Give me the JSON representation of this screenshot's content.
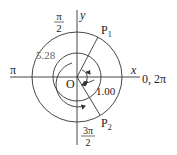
{
  "diagram": {
    "type": "unit-circle angle diagram",
    "axes": {
      "x_label": "x",
      "y_label": "y"
    },
    "origin_label": "O",
    "angle_labels": {
      "right": "0, 2π",
      "top_num": "π",
      "top_den": "2",
      "left": "π",
      "bottom_num": "3π",
      "bottom_den": "2"
    },
    "points": [
      {
        "label": "P",
        "sub": "1"
      },
      {
        "label": "P",
        "sub": "2"
      }
    ],
    "angles": {
      "outer_label": "5.28",
      "inner_label": "1.00"
    }
  }
}
